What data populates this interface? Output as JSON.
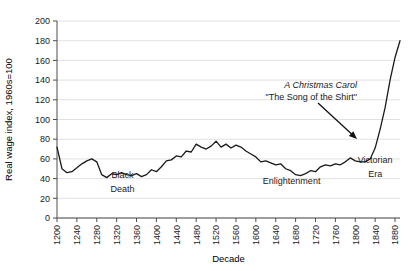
{
  "chart_data": {
    "type": "line",
    "title": "",
    "xlabel": "Decade",
    "ylabel": "Real wage index, 1960s=100",
    "xlim": [
      1200,
      1890
    ],
    "ylim": [
      0,
      200
    ],
    "ytick_step": 20,
    "xtick_step": 40,
    "grid": "horizontal",
    "legend": "none",
    "line_color": "#1a1a1a",
    "yticks": [
      0,
      20,
      40,
      60,
      80,
      100,
      120,
      140,
      160,
      180,
      200
    ],
    "xticks": [
      1200,
      1240,
      1280,
      1320,
      1360,
      1400,
      1440,
      1480,
      1520,
      1560,
      1600,
      1640,
      1680,
      1720,
      1760,
      1800,
      1840,
      1880
    ],
    "x": [
      1200,
      1210,
      1220,
      1230,
      1240,
      1250,
      1260,
      1270,
      1280,
      1290,
      1300,
      1310,
      1320,
      1330,
      1340,
      1350,
      1360,
      1370,
      1380,
      1390,
      1400,
      1410,
      1420,
      1430,
      1440,
      1450,
      1460,
      1470,
      1480,
      1490,
      1500,
      1510,
      1520,
      1530,
      1540,
      1550,
      1560,
      1570,
      1580,
      1590,
      1600,
      1610,
      1620,
      1630,
      1640,
      1650,
      1660,
      1670,
      1680,
      1690,
      1700,
      1710,
      1720,
      1730,
      1740,
      1750,
      1760,
      1770,
      1780,
      1790,
      1800,
      1810,
      1820,
      1830,
      1840,
      1850,
      1860,
      1870,
      1880,
      1890
    ],
    "values": [
      72,
      50,
      46,
      47,
      51,
      55,
      58,
      60,
      57,
      44,
      41,
      45,
      44,
      46,
      44,
      43,
      45,
      42,
      44,
      49,
      47,
      52,
      58,
      59,
      63,
      62,
      68,
      67,
      75,
      72,
      70,
      73,
      78,
      72,
      75,
      71,
      74,
      72,
      68,
      65,
      62,
      57,
      58,
      56,
      54,
      55,
      50,
      48,
      44,
      43,
      45,
      48,
      47,
      52,
      54,
      53,
      55,
      54,
      57,
      61,
      58,
      57,
      57,
      60,
      71,
      90,
      112,
      140,
      163,
      180
    ],
    "series_name": "Real wage index",
    "annotations": [
      {
        "name": "christmas-carol-annotation",
        "lines": [
          {
            "text": "A Christmas Carol",
            "style": "italic"
          },
          {
            "text": "\"The Song of the Shirt\"",
            "style": "plain"
          }
        ],
        "arrow_from": {
          "x": 1815,
          "y": 118
        },
        "arrow_to": {
          "x": 1848,
          "y": 80
        }
      },
      {
        "name": "black-death-label",
        "lines": [
          {
            "text": "Black"
          },
          {
            "text": "Death"
          }
        ],
        "x": 1332,
        "y": 41
      },
      {
        "name": "enlightenment-label",
        "lines": [
          {
            "text": "Enlightenment"
          }
        ],
        "x": 1672,
        "y": 35
      },
      {
        "name": "victorian-era-label",
        "lines": [
          {
            "text": "Victorian"
          },
          {
            "text": "Era"
          }
        ],
        "x": 1840,
        "y": 56
      }
    ]
  }
}
